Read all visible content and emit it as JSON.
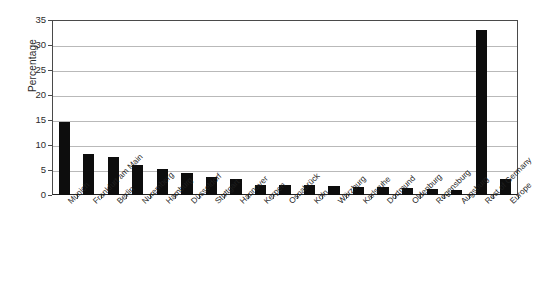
{
  "chart_data": {
    "type": "bar",
    "title": "",
    "xlabel": "",
    "ylabel": "Percentage",
    "ylim": [
      0,
      35
    ],
    "ytick_values": [
      0,
      5,
      10,
      15,
      20,
      25,
      30,
      35
    ],
    "ytick_labels": [
      "0",
      "5",
      "10",
      "15",
      "20",
      "25",
      "30",
      "35"
    ],
    "grid": "horizontal",
    "legend": "none",
    "bar_color": "#0d0d0d",
    "categories": [
      "Munich",
      "Frankfurt am Main",
      "Berlin",
      "Nuremberg",
      "Hamburg",
      "Düsseldorf",
      "Stuttgart",
      "Hannover",
      "Kerpen",
      "Osnabrück",
      "Köln",
      "Würzburg",
      "Karlsruhe",
      "Dortmund",
      "Oldenburg",
      "Regensburg",
      "Augsburg",
      "Rest of Germany",
      "Europe"
    ],
    "values": [
      14.6,
      8.2,
      7.6,
      6.0,
      5.2,
      4.4,
      3.6,
      3.2,
      2.0,
      2.0,
      2.0,
      1.8,
      1.7,
      1.6,
      1.4,
      1.3,
      1.1,
      33.0,
      3.2
    ]
  }
}
